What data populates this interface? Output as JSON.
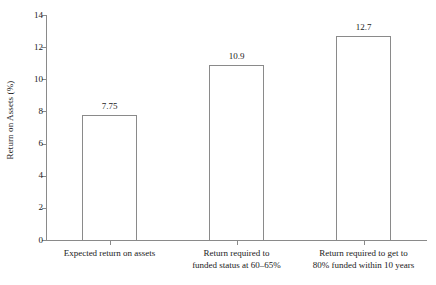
{
  "chart_data": {
    "type": "bar",
    "title": "",
    "subtitle": "",
    "xlabel": "",
    "ylabel": "Return on Assets (%)",
    "categories": [
      "Expected return on assets",
      "Return required to funded status at 60–65%",
      "Return required to get to 80% funded within 10 years"
    ],
    "category_lines": [
      [
        "Expected return on assets"
      ],
      [
        "Return required to",
        "funded status at 60–65%"
      ],
      [
        "Return required to get to",
        "80% funded within 10 years"
      ]
    ],
    "values": [
      7.75,
      10.9,
      12.7
    ],
    "value_labels": [
      "7.75",
      "10.9",
      "12.7"
    ],
    "ylim": [
      0,
      14
    ],
    "ytick_values": [
      0,
      2,
      4,
      6,
      8,
      10,
      12,
      14
    ],
    "ytick_labels": [
      "0",
      "2",
      "4",
      "6",
      "8",
      "10",
      "12",
      "14"
    ],
    "grid": false,
    "legend": null,
    "colors": {
      "bar_fill": "#ffffff",
      "bar_edge": "#8a8a8a",
      "axis": "#8a8a8a",
      "text": "#1a1a1a",
      "background": "#ffffff"
    }
  }
}
